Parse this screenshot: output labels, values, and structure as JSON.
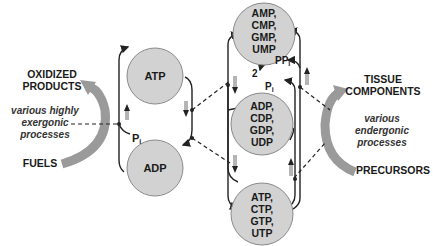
{
  "left_process": {
    "top_label_1": "OXIDIZED",
    "top_label_2": "PRODUCTS",
    "bottom_label": "FUELS",
    "description_1": "various highly",
    "description_2": "exergonic",
    "description_3": "processes"
  },
  "right_process": {
    "top_label_1": "TISSUE",
    "top_label_2": "COMPONENTS",
    "bottom_label": "PRECURSORS",
    "description_1": "various",
    "description_2": "endergonic",
    "description_3": "processes"
  },
  "adenine_cycle": {
    "atp": "ATP",
    "adp": "ADP",
    "pi": "P",
    "pi_sub": "i"
  },
  "nucleotide_nodes": {
    "monophosphates": [
      "AMP,",
      "CMP,",
      "GMP,",
      "UMP"
    ],
    "diphosphates": [
      "ADP,",
      "CDP,",
      "GDP,",
      "UDP"
    ],
    "triphosphates": [
      "ATP,",
      "CTP,",
      "GTP,",
      "UTP"
    ]
  },
  "byproducts": {
    "ppi": "PP",
    "ppi_sub": "i",
    "two": "2",
    "pi": "P",
    "pi_sub": "i"
  },
  "colors": {
    "node_fill": "#d2d2d2",
    "arc": "#9a9a9a",
    "line": "#222222"
  }
}
